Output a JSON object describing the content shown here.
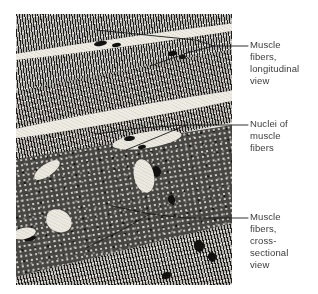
{
  "figure": {
    "name": "skeletal-muscle-histology-figure",
    "background_color": "#ffffff",
    "text_color": "#3b3b3b",
    "micrograph": {
      "name": "skeletal-muscle-micrograph",
      "description": "Black and white histological micrograph of skeletal muscle tissue showing striated muscle fibers in longitudinal section across the upper portion and darker stippled muscle fibers in cross section across the lower left portion.",
      "x": 16,
      "y": 14,
      "width": 216,
      "height": 271
    },
    "labels": [
      {
        "id": "longitudinal",
        "name": "label-muscle-fibers-longitudinal",
        "text": "Muscle\nfibers,\nlongitudinal\nview",
        "lines": [
          "Muscle",
          "fibers,",
          "longitudinal",
          "view"
        ],
        "x": 250,
        "y": 39,
        "leader_y": 46
      },
      {
        "id": "nuclei",
        "name": "label-nuclei-of-muscle-fibers",
        "text": "Nuclei of\nmuscle\nfibers",
        "lines": [
          "Nuclei of",
          "muscle",
          "fibers"
        ],
        "x": 250,
        "y": 118,
        "leader_y": 125
      },
      {
        "id": "cross",
        "name": "label-muscle-fibers-cross-sectional",
        "text": "Muscle\nfibers,\ncross-\nsectional\nview",
        "lines": [
          "Muscle",
          "fibers,",
          "cross-",
          "sectional",
          "view"
        ],
        "x": 250,
        "y": 211,
        "leader_y": 218
      }
    ],
    "leader_line_color": "#1a1a1a"
  }
}
